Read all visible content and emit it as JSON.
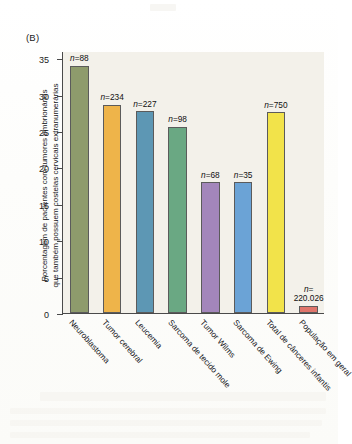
{
  "figure": {
    "panel_label": "(B)",
    "y_axis_title_line1": "Porcentagem de pacientes com tumores embrionários",
    "y_axis_title_line2": "que também possuem costelas cervicais extranumerárias"
  },
  "chart_data": {
    "type": "bar",
    "title": "",
    "xlabel": "",
    "ylabel": "Porcentagem de pacientes com tumores embrionários que também possuem costelas cervicais extranumerárias",
    "ylim": [
      0,
      36
    ],
    "yticks": [
      0,
      5,
      10,
      15,
      20,
      25,
      30,
      35
    ],
    "ytick_labels": [
      "0",
      "5",
      "10",
      "15",
      "20",
      "25",
      "30",
      "35"
    ],
    "grid": false,
    "legend": "none",
    "categories": [
      "Neuroblastoma",
      "Tumor cerebral",
      "Leucemia",
      "Sarcoma de tecido mole",
      "Tumor Wilms",
      "Sarcoma de Ewing",
      "Total de cânceres infantis",
      "População em geral"
    ],
    "values": [
      34.0,
      28.6,
      27.7,
      25.6,
      18.0,
      18.0,
      27.6,
      1.0
    ],
    "annotations": [
      "n=88",
      "n=234",
      "n=227",
      "n=98",
      "n=68",
      "n=35",
      "n=750",
      "n= 220.026"
    ],
    "annotation_lines": [
      [
        "n=88"
      ],
      [
        "n=234"
      ],
      [
        "n=227"
      ],
      [
        "n=98"
      ],
      [
        "n=68"
      ],
      [
        "n=35"
      ],
      [
        "n=750"
      ],
      [
        "n=",
        "220.026"
      ]
    ],
    "bar_colors": [
      "#8e9b6c",
      "#eeb44a",
      "#5d97b4",
      "#6aa883",
      "#a386bb",
      "#6ba3d6",
      "#f2e34a",
      "#e0756b"
    ],
    "bar_edge_color": "#5b5b5b",
    "plot_background": "#f3f1ea",
    "axis_color": "#4a4a4a"
  }
}
